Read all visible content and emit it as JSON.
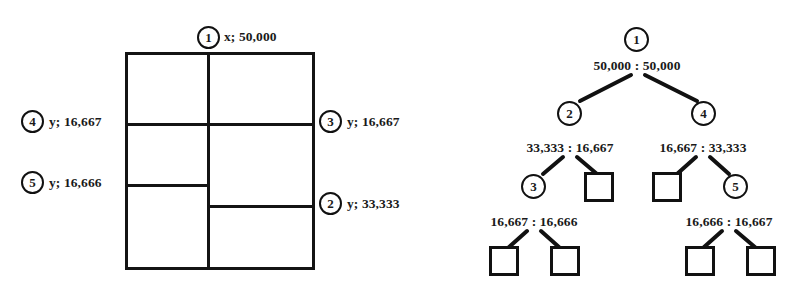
{
  "figure": {
    "background": "#ffffff",
    "ink": "#111111"
  },
  "partition_diagram": {
    "name": "rectangle-partition",
    "cuts": [
      {
        "id": "1",
        "axis": "x",
        "value": "50,000",
        "label": "x; 50,000",
        "position": "top"
      },
      {
        "id": "2",
        "axis": "y",
        "value": "33,333",
        "label": "y; 33,333",
        "position": "right"
      },
      {
        "id": "3",
        "axis": "y",
        "value": "16,667",
        "label": "y; 16,667",
        "position": "right"
      },
      {
        "id": "4",
        "axis": "y",
        "value": "16,667",
        "label": "y; 16,667",
        "position": "left"
      },
      {
        "id": "5",
        "axis": "y",
        "value": "16,666",
        "label": "y; 16,666",
        "position": "left"
      }
    ]
  },
  "tree_diagram": {
    "name": "partition-tree",
    "nodes": [
      {
        "id": "1",
        "shape": "circle",
        "level": 0
      },
      {
        "id": "2",
        "shape": "circle",
        "level": 1
      },
      {
        "id": "4",
        "shape": "circle",
        "level": 1
      },
      {
        "id": "3",
        "shape": "circle",
        "level": 2
      },
      {
        "id": "5",
        "shape": "circle",
        "level": 2
      },
      {
        "id": "leaf-2r",
        "shape": "square",
        "level": 2
      },
      {
        "id": "leaf-4l",
        "shape": "square",
        "level": 2
      },
      {
        "id": "leaf-3l",
        "shape": "square",
        "level": 3
      },
      {
        "id": "leaf-3r",
        "shape": "square",
        "level": 3
      },
      {
        "id": "leaf-5l",
        "shape": "square",
        "level": 3
      },
      {
        "id": "leaf-5r",
        "shape": "square",
        "level": 3
      }
    ],
    "split_labels": [
      {
        "id": "split-1",
        "text": "50,000 : 50,000",
        "left": "50,000",
        "right": "50,000"
      },
      {
        "id": "split-2",
        "text": "33,333 : 16,667",
        "left": "33,333",
        "right": "16,667"
      },
      {
        "id": "split-4",
        "text": "16,667 : 33,333",
        "left": "16,667",
        "right": "33,333"
      },
      {
        "id": "split-3",
        "text": "16,667 : 16,666",
        "left": "16,667",
        "right": "16,666"
      },
      {
        "id": "split-5",
        "text": "16,666 : 16,667",
        "left": "16,666",
        "right": "16,667"
      }
    ]
  }
}
